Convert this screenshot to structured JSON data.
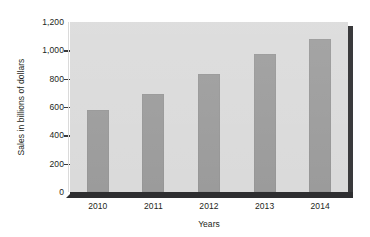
{
  "chart_data": {
    "type": "bar",
    "title": "",
    "xlabel": "Years",
    "ylabel": "Sales in billions of dollars",
    "categories": [
      "2010",
      "2011",
      "2012",
      "2013",
      "2014"
    ],
    "values": [
      580,
      690,
      830,
      975,
      1080
    ],
    "series": [
      {
        "name": "Sales",
        "values": [
          580,
          690,
          830,
          975,
          1080
        ]
      }
    ],
    "ylim": [
      0,
      1200
    ],
    "yticks": [
      0,
      200,
      400,
      600,
      800,
      1000,
      1200
    ],
    "ytick_labels": [
      "0",
      "200",
      "400",
      "600",
      "800",
      "1,000",
      "1,200"
    ],
    "grid": false,
    "legend": false,
    "legend_position": "none",
    "colors": {
      "bar": "#9b9b9b",
      "plot_background": "#dadada",
      "page_background": "#ffffff",
      "axis_text": "#231f20",
      "depth_shadow": "#2e2e30"
    }
  }
}
